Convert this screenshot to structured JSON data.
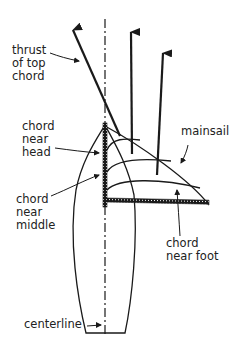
{
  "diagram": {
    "colors": {
      "ink": "#1a1a1a",
      "background": "#ffffff"
    },
    "labels": {
      "thrust_top_chord": [
        "thrust",
        "of top",
        "chord"
      ],
      "chord_near_head": [
        "chord",
        "near",
        "head"
      ],
      "chord_near_middle": [
        "chord",
        "near",
        "middle"
      ],
      "mainsail": [
        "mainsail"
      ],
      "chord_near_foot": [
        "chord",
        "near foot"
      ],
      "centerline": [
        "centerline"
      ]
    }
  }
}
